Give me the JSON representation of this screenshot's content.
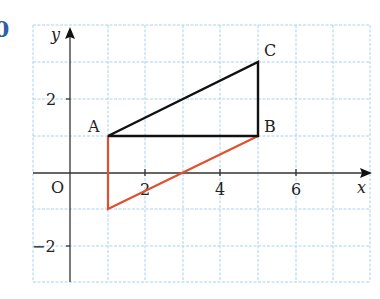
{
  "exercise": {
    "number": "0"
  },
  "axes": {
    "x_label": "x",
    "y_label": "y",
    "origin_label": "O",
    "x_ticks": [
      {
        "value": 2,
        "label": "2"
      },
      {
        "value": 4,
        "label": "4"
      },
      {
        "value": 6,
        "label": "6"
      }
    ],
    "y_ticks": [
      {
        "value": 2,
        "label": "2"
      },
      {
        "value": -2,
        "label": "−2"
      }
    ],
    "x_range": [
      -1,
      8
    ],
    "y_range": [
      -3,
      4
    ]
  },
  "points": {
    "A": {
      "label": "A",
      "x": 1,
      "y": 1
    },
    "B": {
      "label": "B",
      "x": 5,
      "y": 1
    },
    "C": {
      "label": "C",
      "x": 5,
      "y": 3
    },
    "D": {
      "label": "",
      "x": 1,
      "y": -1
    }
  },
  "shapes": {
    "triangle_ABC": {
      "vertices": [
        "A",
        "B",
        "C"
      ],
      "color": "#111111"
    },
    "triangle_ABD": {
      "vertices": [
        "A",
        "D",
        "B"
      ],
      "color": "#e0502f"
    }
  },
  "colors": {
    "grid": "#a9d4ec",
    "axis": "#333333",
    "exercise_number": "#2f5fa6"
  }
}
